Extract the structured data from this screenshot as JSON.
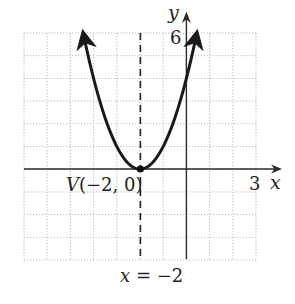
{
  "chart_data": {
    "type": "line",
    "title": "",
    "function": "y = (x + 2)^2",
    "xlabel": "x",
    "ylabel": "y",
    "xlim": [
      -7,
      3
    ],
    "ylim": [
      -4,
      6
    ],
    "grid": true,
    "x_tick_labels": [
      {
        "value": 3,
        "label": "3"
      }
    ],
    "y_tick_labels": [
      {
        "value": 6,
        "label": "6"
      }
    ],
    "series": [
      {
        "name": "parabola",
        "x": [
          -4.45,
          -4,
          -3.5,
          -3,
          -2.5,
          -2,
          -1.5,
          -1,
          -0.5,
          0,
          0.45
        ],
        "y": [
          6.0,
          4,
          2.25,
          1,
          0.25,
          0,
          0.25,
          1,
          2.25,
          4,
          6.0
        ]
      }
    ],
    "vertex": {
      "x": -2,
      "y": 0,
      "label": "V(−2, 0)"
    },
    "axis_of_symmetry": {
      "x": -2,
      "label": "x = −2",
      "style": "dashed"
    },
    "annotations": [
      "V(−2, 0)",
      "x = −2"
    ]
  },
  "labels": {
    "x_axis": "x",
    "y_axis": "y",
    "x_tick": "3",
    "y_tick": "6",
    "vertex": "V(−2, 0)",
    "axis_of_symmetry_eq_left": "x",
    "axis_of_symmetry_eq_right": " = −2"
  },
  "colors": {
    "curve": "#1a1a1a",
    "axes": "#2a2a2a",
    "grid": "#b0b0b0"
  }
}
